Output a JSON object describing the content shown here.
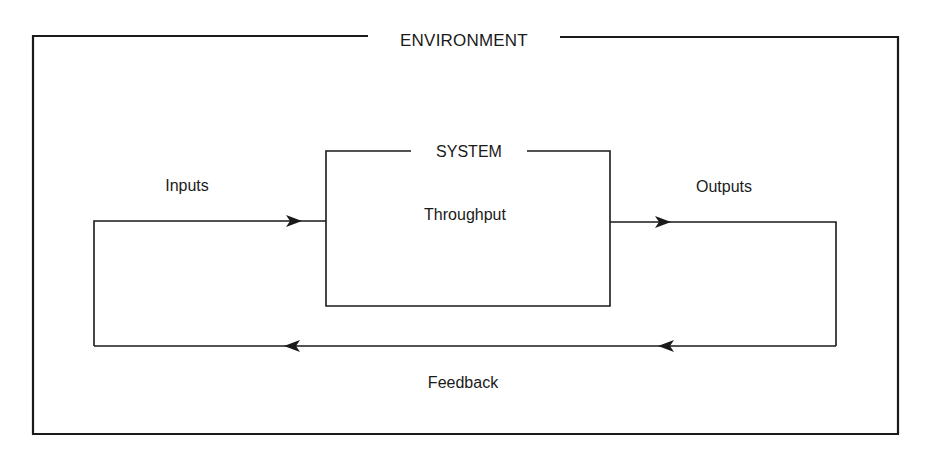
{
  "diagram": {
    "type": "block-diagram",
    "colors": {
      "background": "#ffffff",
      "stroke": "#1a1a1a",
      "text": "#1a1a1a"
    },
    "environment": {
      "label": "ENVIRONMENT"
    },
    "system": {
      "label": "SYSTEM",
      "content": "Throughput"
    },
    "flows": {
      "inputs": {
        "label": "Inputs",
        "direction": "into-system"
      },
      "outputs": {
        "label": "Outputs",
        "direction": "out-of-system"
      },
      "feedback": {
        "label": "Feedback",
        "direction": "outputs-to-inputs"
      }
    },
    "nodes": [
      {
        "id": "environment",
        "label": "ENVIRONMENT",
        "kind": "container"
      },
      {
        "id": "system",
        "label": "SYSTEM",
        "kind": "box",
        "content": "Throughput"
      }
    ],
    "edges": [
      {
        "from": "environment",
        "to": "system",
        "label": "Inputs"
      },
      {
        "from": "system",
        "to": "environment",
        "label": "Outputs"
      },
      {
        "from": "outputs",
        "to": "inputs",
        "label": "Feedback"
      }
    ]
  }
}
